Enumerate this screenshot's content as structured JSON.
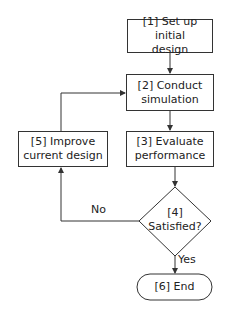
{
  "diagram": {
    "type": "flowchart",
    "nodes": [
      {
        "id": "1",
        "shape": "rectangle",
        "line1": "[1] Set up initial",
        "line2": "design"
      },
      {
        "id": "2",
        "shape": "rectangle",
        "line1": "[2] Conduct",
        "line2": "simulation"
      },
      {
        "id": "3",
        "shape": "rectangle",
        "line1": "[3] Evaluate",
        "line2": "performance"
      },
      {
        "id": "4",
        "shape": "diamond",
        "line1": "[4]",
        "line2": "Satisfied?"
      },
      {
        "id": "5",
        "shape": "rectangle",
        "line1": "[5] Improve",
        "line2": "current design"
      },
      {
        "id": "6",
        "shape": "terminator",
        "line1": "[6] End"
      }
    ],
    "edges": [
      {
        "from": "1",
        "to": "2",
        "label": ""
      },
      {
        "from": "2",
        "to": "3",
        "label": ""
      },
      {
        "from": "3",
        "to": "4",
        "label": ""
      },
      {
        "from": "4",
        "to": "6",
        "label": "Yes"
      },
      {
        "from": "4",
        "to": "5",
        "label": "No"
      },
      {
        "from": "5",
        "to": "2",
        "label": ""
      }
    ],
    "labels": {
      "yes": "Yes",
      "no": "No"
    },
    "colors": {
      "stroke": "#333333",
      "text": "#222222",
      "background": "#ffffff"
    }
  }
}
